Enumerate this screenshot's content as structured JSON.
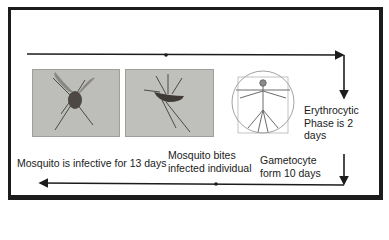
{
  "diagram": {
    "type": "malaria-transmission-cycle",
    "stages": [
      {
        "id": "mosquito-infective",
        "label": "Mosquito is infective for 13 days"
      },
      {
        "id": "mosquito-bites",
        "label_lines": [
          "Mosquito bites",
          "infected individual"
        ]
      },
      {
        "id": "erythrocytic",
        "label_lines": [
          "Erythrocytic",
          "Phase is 2",
          "days"
        ]
      },
      {
        "id": "gametocyte",
        "label_lines": [
          "Gametocyte",
          "form 10 days"
        ]
      }
    ],
    "images": [
      {
        "id": "mosquito-photo-1",
        "depicts": "mosquito"
      },
      {
        "id": "mosquito-photo-2",
        "depicts": "mosquito biting"
      },
      {
        "id": "vitruvian-man",
        "depicts": "human figure"
      }
    ],
    "colors": {
      "line": "#1c1c1c",
      "photo_bg": "#b9b9b6",
      "text": "#1a1a1a"
    }
  }
}
